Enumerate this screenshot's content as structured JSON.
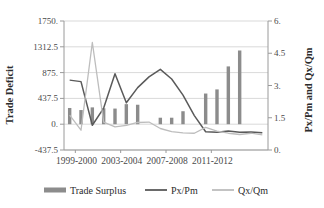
{
  "chart_data": {
    "type": "bar",
    "title": "",
    "subtitle": "",
    "xlabel": "",
    "ylabel": "Trade Deficit",
    "y2label": "Px/Pm and Qx/Qm",
    "grid": true,
    "legend_position": "bottom",
    "categories": [
      "1999-2000",
      "2000-2001",
      "2001-2002",
      "2002-2003",
      "2003-2004",
      "2004-2005",
      "2005-2006",
      "2006-2007",
      "2007-2008",
      "2008-2009",
      "2009-2010",
      "2010-2011",
      "2011-2012",
      "2012-2013",
      "2013-2014",
      "2014-2015",
      "2015-2016",
      "2016-2017"
    ],
    "xtick_labels": [
      "1999-2000",
      "2003-2004",
      "2007-2008",
      "2011-2012"
    ],
    "xtick_indices": [
      0,
      4,
      8,
      12
    ],
    "ylim": [
      -437.5,
      1750
    ],
    "ytick_labels": [
      "1750.",
      "1312.5",
      "875.",
      "437.5",
      "0.",
      "-437.5"
    ],
    "yticks": [
      1750,
      1312.5,
      875,
      437.5,
      0,
      -437.5
    ],
    "y2lim": [
      0,
      6
    ],
    "y2tick_labels": [
      "6.",
      "4.5",
      "3.",
      "1.5",
      "0."
    ],
    "y2ticks": [
      6,
      4.5,
      3,
      1.5,
      0
    ],
    "series": [
      {
        "name": "Trade Surplus",
        "type": "bar",
        "axis": "left",
        "color": "#8c8c8c",
        "values": [
          275,
          240,
          285,
          270,
          265,
          340,
          330,
          0,
          110,
          110,
          220,
          0,
          520,
          590,
          980,
          1250,
          0,
          0
        ]
      },
      {
        "name": "Px/Pm",
        "type": "line",
        "axis": "right",
        "color": "#5a5a5a",
        "values": [
          3.25,
          3.18,
          1.15,
          1.95,
          3.55,
          2.2,
          2.9,
          3.4,
          3.75,
          3.3,
          2.55,
          1.6,
          0.85,
          0.82,
          0.88,
          0.82,
          0.84,
          0.8
        ]
      },
      {
        "name": "Qx/Qm",
        "type": "line",
        "axis": "right",
        "color": "#bdbdbd",
        "values": [
          1.62,
          0.92,
          5.0,
          1.3,
          1.08,
          1.15,
          1.28,
          1.3,
          1.0,
          0.85,
          0.8,
          0.78,
          1.05,
          0.88,
          0.78,
          0.72,
          0.78,
          0.7
        ]
      }
    ]
  },
  "legend": {
    "items": [
      {
        "label": "Trade Surplus",
        "marker": "bar-swatch",
        "color": "#8c8c8c"
      },
      {
        "label": "Px/Pm",
        "marker": "line-swatch",
        "color": "#5a5a5a"
      },
      {
        "label": "Qx/Qm",
        "marker": "line-swatch",
        "color": "#bdbdbd"
      }
    ]
  },
  "axes": {
    "left_title": "Trade Deficit",
    "right_title": "Px/Pm and Qx/Qm"
  },
  "colors": {
    "bar": "#8c8c8c",
    "px_pm_line": "#5a5a5a",
    "qx_qm_line": "#bdbdbd",
    "grid": "#cfcfcf",
    "frame": "#9a9a9a",
    "text": "#3a3a3a"
  }
}
